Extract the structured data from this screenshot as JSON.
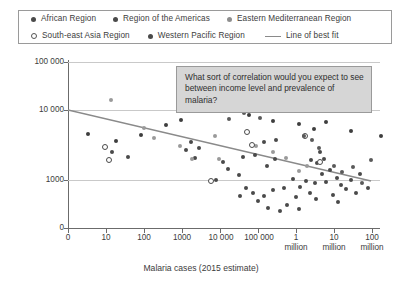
{
  "legend": {
    "rows": [
      [
        {
          "label": "African Region",
          "marker": "solid-dot",
          "color": "#4a4a4a"
        },
        {
          "label": "Region of the Americas",
          "marker": "solid-dot",
          "color": "#3e3e3e"
        },
        {
          "label": "Eastern Mediterranean Region",
          "marker": "gray-dot",
          "color": "#9a9a9a"
        }
      ],
      [
        {
          "label": "South-east Asia Region",
          "marker": "hollow-dot",
          "color": "#ffffff"
        },
        {
          "label": "Western Pacific Region",
          "marker": "solid-dot",
          "color": "#5a5a5a"
        },
        {
          "label": "Line of best fit",
          "marker": "line",
          "color": "#8a8a8a"
        }
      ]
    ]
  },
  "annotation": {
    "text": "What sort of correlation would you expect to see between income level and prevalence of malaria?"
  },
  "chart_data": {
    "type": "scatter",
    "title": "",
    "xlabel": "Malaria cases (2015 estimate)",
    "ylabel": "GNI per capita (US$)",
    "xscale": "log",
    "yscale": "log",
    "grid": true,
    "legend_position": "top",
    "xticklabels": [
      "0",
      "10",
      "100",
      "1000",
      "10 000",
      "100 000",
      "1",
      "10",
      "100"
    ],
    "xticklabels_second_line": [
      "",
      "",
      "",
      "",
      "",
      "",
      "million",
      "million",
      "million"
    ],
    "yticklabels": [
      "100 000",
      "10 000",
      "1000",
      "0"
    ],
    "ylim": [
      1000,
      100000
    ],
    "xlim": [
      0,
      100000000
    ],
    "annotations": [
      {
        "text": "What sort of correlation would you expect to see between income level and prevalence of malaria?"
      }
    ],
    "best_fit_line": {
      "label": "Line of best fit",
      "color": "#8a8a8a",
      "x_start_px": 0,
      "y_start_px": 48,
      "x_end_px": 303,
      "y_end_px": 119
    },
    "series": [
      {
        "name": "African Region",
        "marker": "solid-dot",
        "color": "#4a4a4a",
        "points_px": [
          [
            44,
            90
          ],
          [
            60,
            95
          ],
          [
            118,
            88
          ],
          [
            123,
            80
          ],
          [
            131,
            86
          ],
          [
            127,
            96
          ],
          [
            155,
            100
          ],
          [
            160,
            107
          ],
          [
            148,
            118
          ],
          [
            175,
            95
          ],
          [
            187,
            93
          ],
          [
            171,
            113
          ],
          [
            196,
            80
          ],
          [
            208,
            78
          ],
          [
            178,
            126
          ],
          [
            172,
            134
          ],
          [
            185,
            131
          ],
          [
            190,
            139
          ],
          [
            196,
            134
          ],
          [
            205,
            128
          ],
          [
            216,
            126
          ],
          [
            225,
            117
          ],
          [
            232,
            125
          ],
          [
            228,
            135
          ],
          [
            238,
            119
          ],
          [
            242,
            131
          ],
          [
            248,
            137
          ],
          [
            200,
            146
          ],
          [
            212,
            149
          ],
          [
            219,
            143
          ],
          [
            231,
            147
          ],
          [
            247,
            121
          ],
          [
            254,
            112
          ],
          [
            258,
            120
          ],
          [
            262,
            108
          ],
          [
            243,
            98
          ],
          [
            249,
            101
          ],
          [
            256,
            97
          ],
          [
            269,
            116
          ],
          [
            273,
            123
          ],
          [
            278,
            127
          ],
          [
            265,
            133
          ],
          [
            270,
            140
          ],
          [
            283,
            118
          ],
          [
            288,
            131
          ],
          [
            292,
            112
          ],
          [
            300,
            126
          ],
          [
            252,
            90
          ],
          [
            199,
            104
          ],
          [
            207,
            97
          ]
        ]
      },
      {
        "name": "Region of the Americas",
        "marker": "solid-dot",
        "color": "#3e3e3e",
        "points_px": [
          [
            20,
            72
          ],
          [
            48,
            79
          ],
          [
            73,
            73
          ],
          [
            98,
            63
          ],
          [
            113,
            58
          ],
          [
            140,
            46
          ],
          [
            181,
            53
          ],
          [
            205,
            59
          ],
          [
            246,
            67
          ],
          [
            283,
            69
          ],
          [
            313,
            74
          ],
          [
            258,
            60
          ],
          [
            231,
            62
          ]
        ]
      },
      {
        "name": "Eastern Mediterranean Region",
        "marker": "gray-dot",
        "color": "#9a9a9a",
        "points_px": [
          [
            43,
            38
          ],
          [
            76,
            66
          ],
          [
            86,
            76
          ],
          [
            112,
            84
          ],
          [
            124,
            97
          ],
          [
            151,
            97
          ],
          [
            188,
            84
          ],
          [
            205,
            90
          ],
          [
            218,
            96
          ],
          [
            147,
            74
          ],
          [
            231,
            109
          ],
          [
            239,
            104
          ]
        ]
      },
      {
        "name": "South-east Asia Region",
        "marker": "hollow-dot",
        "color": "#ffffff",
        "points_px": [
          [
            36,
            84
          ],
          [
            40,
            97
          ],
          [
            142,
            118
          ],
          [
            178,
            69
          ],
          [
            183,
            82
          ],
          [
            236,
            73
          ],
          [
            251,
            99
          ]
        ]
      },
      {
        "name": "Western Pacific Region",
        "marker": "solid-dot",
        "color": "#5a5a5a",
        "points_px": [
          [
            161,
            57
          ],
          [
            176,
            51
          ],
          [
            192,
            56
          ],
          [
            236,
            74
          ],
          [
            244,
            78
          ],
          [
            251,
            86
          ],
          [
            266,
            104
          ],
          [
            274,
            110
          ],
          [
            285,
            105
          ],
          [
            294,
            121
          ],
          [
            303,
            98
          ]
        ]
      }
    ]
  }
}
